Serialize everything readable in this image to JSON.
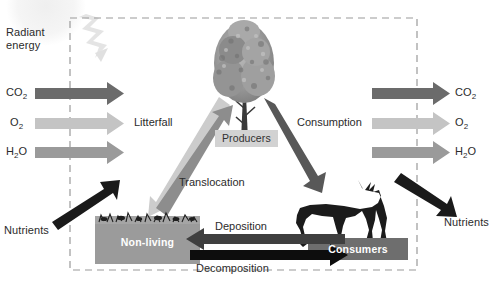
{
  "figure": {
    "boundary_style": "dashed-ecosystem-boundary"
  },
  "colors": {
    "co2_arrow": "#6b6b6b",
    "o2_arrow": "#c4c4c4",
    "h2o_arrow": "#9a9a9a",
    "litterfall_arrow": "#cccccc",
    "translocation_arrow": "#8d8d8d",
    "consumption_arrow": "#585858",
    "nutrients_arrow": "#1a1a1a",
    "deposition_arrow": "#3f3f3f",
    "decomposition_arrow": "#0d0d0d",
    "radiant_energy_bolt": "#e2e2e2",
    "sun": "#f0f0f0",
    "nonliving_box": "#9b9b9b",
    "consumers_box": "#6e6e6e",
    "producers_chip": "#d2d2d2",
    "boundary_dash": "#9a9a9a",
    "text": "#2b2b2b",
    "box_text": "#ffffff"
  },
  "external_inputs": {
    "radiant_energy": {
      "line1": "Radiant",
      "line2": "energy"
    },
    "left_gases": [
      {
        "label": "CO",
        "sub": "2",
        "name": "co2",
        "direction": "into-ecosystem"
      },
      {
        "label": "O",
        "sub": "2",
        "name": "o2",
        "direction": "into-ecosystem"
      },
      {
        "label": "H",
        "sub": "2",
        "label_tail": "O",
        "name": "h2o",
        "direction": "into-ecosystem"
      }
    ],
    "left_nutrients": "Nutrients"
  },
  "external_outputs": {
    "right_gases": [
      {
        "label": "CO",
        "sub": "2",
        "name": "co2",
        "direction": "out-of-ecosystem"
      },
      {
        "label": "O",
        "sub": "2",
        "name": "o2",
        "direction": "out-of-ecosystem"
      },
      {
        "label": "H",
        "sub": "2",
        "label_tail": "O",
        "name": "h2o",
        "direction": "out-of-ecosystem"
      }
    ],
    "right_nutrients": "Nutrients"
  },
  "compartments": {
    "producers": {
      "label": "Producers",
      "icon": "tree-icon"
    },
    "consumers": {
      "label": "Consumers",
      "icon": "deer-icon"
    },
    "nonliving": {
      "label": "Non-living",
      "icon": "soil-litter-icon"
    }
  },
  "flows": [
    {
      "label": "Litterfall",
      "from": "producers",
      "to": "nonliving",
      "name": "litterfall"
    },
    {
      "label": "Translocation",
      "from": "nonliving",
      "to": "producers",
      "name": "translocation"
    },
    {
      "label": "Consumption",
      "from": "producers",
      "to": "consumers",
      "name": "consumption"
    },
    {
      "label": "Deposition",
      "from": "consumers",
      "to": "nonliving",
      "name": "deposition"
    },
    {
      "label": "Decomposition",
      "from": "nonliving",
      "to": "consumers",
      "name": "decomposition"
    }
  ]
}
